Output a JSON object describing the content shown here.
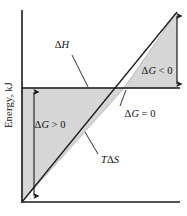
{
  "figure": {
    "type": "line-diagram",
    "background_color": "#ffffff",
    "axis_color": "#1a1a1a",
    "shade_color": "#d6d6d6",
    "shade_edge_color": "#8a8a8a",
    "line_color": "#1a1a1a",
    "axes": {
      "y_label": "Energy, kJ",
      "x_label": "",
      "y_axis": {
        "x": 22,
        "y_top": 10,
        "y_bottom": 202
      },
      "x_axis": {
        "y": 202,
        "x_left": 22,
        "x_right": 180
      }
    },
    "curves": [
      {
        "name": "enthalpy-line",
        "label": "ΔH",
        "description": "horizontal constant enthalpy line",
        "x1": 22,
        "y1": 88,
        "x2": 180,
        "y2": 88
      },
      {
        "name": "entropy-line",
        "label": "TΔS",
        "description": "diagonal temperature-times-entropy line through origin",
        "x1": 22,
        "y1": 202,
        "x2": 177,
        "y2": 12
      }
    ],
    "intersection": {
      "name": "equilibrium-point",
      "label": "ΔG = 0",
      "x": 124,
      "y": 88
    },
    "regions": [
      {
        "name": "positive-delta-g-region",
        "label": "ΔG > 0",
        "points": "22,88 124,88 22,202"
      },
      {
        "name": "negative-delta-g-region",
        "label": "ΔG < 0",
        "points": "124,88 177,12 177,88"
      }
    ],
    "measures": [
      {
        "name": "positive-delta-g-arrow",
        "orientation": "vertical",
        "x": 34,
        "y_top": 88,
        "y_bottom": 200
      },
      {
        "name": "negative-delta-g-arrow",
        "orientation": "vertical",
        "x": 177,
        "y_top": 12,
        "y_bottom": 88
      }
    ],
    "labels": {
      "y_axis_title": "Energy, kJ",
      "enthalpy": "ΔH",
      "entropy": "TΔS",
      "delta_g_positive": "ΔG > 0",
      "delta_g_zero": "ΔG = 0",
      "delta_g_negative": "ΔG < 0"
    },
    "label_parts": {
      "enthalpy_delta": "Δ",
      "enthalpy_var": "H",
      "entropy_t": "T",
      "entropy_delta": "Δ",
      "entropy_var": "S",
      "dg_delta": "Δ",
      "dg_var": "G",
      "gt_zero": " > 0",
      "eq_zero": " = 0",
      "lt_zero": " < 0"
    },
    "leaders": [
      {
        "name": "enthalpy-leader",
        "x1": 72,
        "y1": 55,
        "x2": 88,
        "y2": 87
      },
      {
        "name": "entropy-leader",
        "x1": 98,
        "y1": 155,
        "x2": 85,
        "y2": 133
      },
      {
        "name": "equilibrium-leader",
        "x1": 120,
        "y1": 106,
        "x2": 126,
        "y2": 91
      }
    ]
  }
}
